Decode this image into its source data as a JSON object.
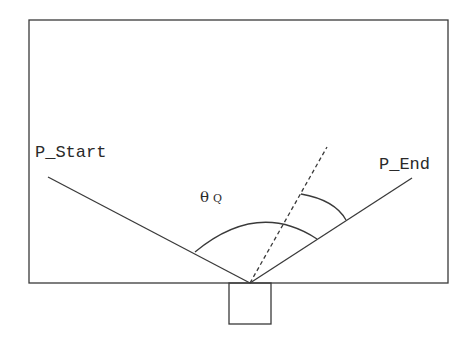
{
  "diagram": {
    "labels": {
      "start": "P_Start",
      "end": "P_End",
      "angle_symbol": "θ",
      "angle_subscript": "Q"
    },
    "colors": {
      "stroke": "#3a3a3a",
      "background": "#ffffff"
    }
  }
}
